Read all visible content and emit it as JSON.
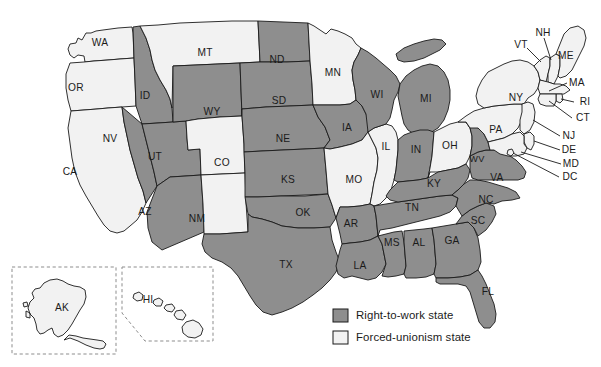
{
  "map": {
    "title": "United States right-to-work status map",
    "colors": {
      "right_to_work_fill": "#8e8e8e",
      "forced_unionism_fill": "#f2f2f2",
      "border": "#1a1a1a",
      "background": "#ffffff",
      "inset_border": "#8d8d8d"
    },
    "states": [
      {
        "code": "WA",
        "status": "forced-unionism",
        "x": 100,
        "y": 43
      },
      {
        "code": "OR",
        "status": "forced-unionism",
        "x": 76,
        "y": 88
      },
      {
        "code": "CA",
        "status": "forced-unionism",
        "x": 70,
        "y": 172
      },
      {
        "code": "ID",
        "status": "right-to-work",
        "x": 145,
        "y": 96
      },
      {
        "code": "NV",
        "status": "right-to-work",
        "x": 110,
        "y": 139
      },
      {
        "code": "UT",
        "status": "right-to-work",
        "x": 155,
        "y": 157
      },
      {
        "code": "AZ",
        "status": "right-to-work",
        "x": 145,
        "y": 212
      },
      {
        "code": "MT",
        "status": "forced-unionism",
        "x": 205,
        "y": 53
      },
      {
        "code": "WY",
        "status": "right-to-work",
        "x": 212,
        "y": 112
      },
      {
        "code": "CO",
        "status": "forced-unionism",
        "x": 222,
        "y": 163
      },
      {
        "code": "NM",
        "status": "forced-unionism",
        "x": 197,
        "y": 219
      },
      {
        "code": "ND",
        "status": "right-to-work",
        "x": 277,
        "y": 60
      },
      {
        "code": "SD",
        "status": "right-to-work",
        "x": 279,
        "y": 101
      },
      {
        "code": "NE",
        "status": "right-to-work",
        "x": 283,
        "y": 139
      },
      {
        "code": "KS",
        "status": "right-to-work",
        "x": 288,
        "y": 180
      },
      {
        "code": "OK",
        "status": "right-to-work",
        "x": 303,
        "y": 213
      },
      {
        "code": "TX",
        "status": "right-to-work",
        "x": 286,
        "y": 265
      },
      {
        "code": "MN",
        "status": "forced-unionism",
        "x": 333,
        "y": 73
      },
      {
        "code": "IA",
        "status": "right-to-work",
        "x": 347,
        "y": 128
      },
      {
        "code": "MO",
        "status": "forced-unionism",
        "x": 354,
        "y": 180
      },
      {
        "code": "AR",
        "status": "right-to-work",
        "x": 351,
        "y": 224
      },
      {
        "code": "LA",
        "status": "right-to-work",
        "x": 360,
        "y": 266
      },
      {
        "code": "WI",
        "status": "right-to-work",
        "x": 377,
        "y": 95
      },
      {
        "code": "IL",
        "status": "forced-unionism",
        "x": 386,
        "y": 147
      },
      {
        "code": "MS",
        "status": "right-to-work",
        "x": 392,
        "y": 243
      },
      {
        "code": "MI",
        "status": "right-to-work",
        "x": 426,
        "y": 99
      },
      {
        "code": "IN",
        "status": "right-to-work",
        "x": 416,
        "y": 150
      },
      {
        "code": "AL",
        "status": "right-to-work",
        "x": 419,
        "y": 243
      },
      {
        "code": "TN",
        "status": "right-to-work",
        "x": 412,
        "y": 208
      },
      {
        "code": "KY",
        "status": "right-to-work",
        "x": 434,
        "y": 184
      },
      {
        "code": "OH",
        "status": "forced-unionism",
        "x": 450,
        "y": 146
      },
      {
        "code": "GA",
        "status": "right-to-work",
        "x": 452,
        "y": 241
      },
      {
        "code": "FL",
        "status": "right-to-work",
        "x": 488,
        "y": 292
      },
      {
        "code": "SC",
        "status": "right-to-work",
        "x": 478,
        "y": 221
      },
      {
        "code": "NC",
        "status": "right-to-work",
        "x": 486,
        "y": 200
      },
      {
        "code": "VA",
        "status": "right-to-work",
        "x": 497,
        "y": 178
      },
      {
        "code": "WV",
        "status": "right-to-work",
        "x": 477,
        "y": 160
      },
      {
        "code": "PA",
        "status": "forced-unionism",
        "x": 496,
        "y": 130
      },
      {
        "code": "NY",
        "status": "forced-unionism",
        "x": 516,
        "y": 98
      },
      {
        "code": "ME",
        "status": "forced-unionism",
        "x": 566,
        "y": 56
      },
      {
        "code": "AK",
        "status": "forced-unionism",
        "x": 62,
        "y": 308
      },
      {
        "code": "HI",
        "status": "forced-unionism",
        "x": 148,
        "y": 300
      }
    ],
    "leader_labels": [
      {
        "code": "VT",
        "status": "forced-unionism",
        "x": 521,
        "y": 45
      },
      {
        "code": "NH",
        "status": "forced-unionism",
        "x": 543,
        "y": 33
      },
      {
        "code": "MA",
        "status": "forced-unionism",
        "x": 577,
        "y": 83
      },
      {
        "code": "RI",
        "status": "forced-unionism",
        "x": 585,
        "y": 102
      },
      {
        "code": "CT",
        "status": "forced-unionism",
        "x": 583,
        "y": 118
      },
      {
        "code": "NJ",
        "status": "forced-unionism",
        "x": 569,
        "y": 136
      },
      {
        "code": "DE",
        "status": "forced-unionism",
        "x": 569,
        "y": 150
      },
      {
        "code": "MD",
        "status": "forced-unionism",
        "x": 571,
        "y": 164
      },
      {
        "code": "DC",
        "status": "forced-unionism",
        "x": 570,
        "y": 177
      }
    ],
    "insets": [
      {
        "name": "alaska-inset",
        "label": "AK"
      },
      {
        "name": "hawaii-inset",
        "label": "HI"
      }
    ]
  },
  "legend": {
    "items": [
      {
        "key": "right-to-work",
        "label": "Right-to-work state",
        "swatch": "#8e8e8e"
      },
      {
        "key": "forced-unionism",
        "label": "Forced-unionism state",
        "swatch": "#f2f2f2"
      }
    ]
  }
}
